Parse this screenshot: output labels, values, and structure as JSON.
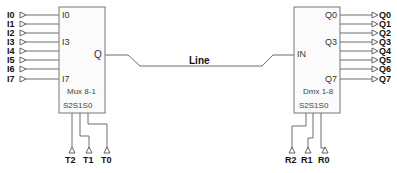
{
  "diagram": {
    "mux": {
      "name": "Mux 8-1",
      "select_label": "S2S1S0",
      "inputs_shown": [
        "I0",
        "I3",
        "I7"
      ],
      "output": "Q",
      "input_pins": [
        "I0",
        "I1",
        "I2",
        "I3",
        "I4",
        "I5",
        "I6",
        "I7"
      ],
      "select_pins": [
        "T2",
        "T1",
        "T0"
      ]
    },
    "dmx": {
      "name": "Dmx 1-8",
      "select_label": "S2S1S0",
      "input": "IN",
      "outputs_shown": [
        "Q0",
        "Q3",
        "Q7"
      ],
      "output_pins": [
        "Q0",
        "Q1",
        "Q2",
        "Q3",
        "Q4",
        "Q5",
        "Q6",
        "Q7"
      ],
      "select_pins": [
        "R2",
        "R1",
        "R0"
      ]
    },
    "link_label": "Line"
  }
}
